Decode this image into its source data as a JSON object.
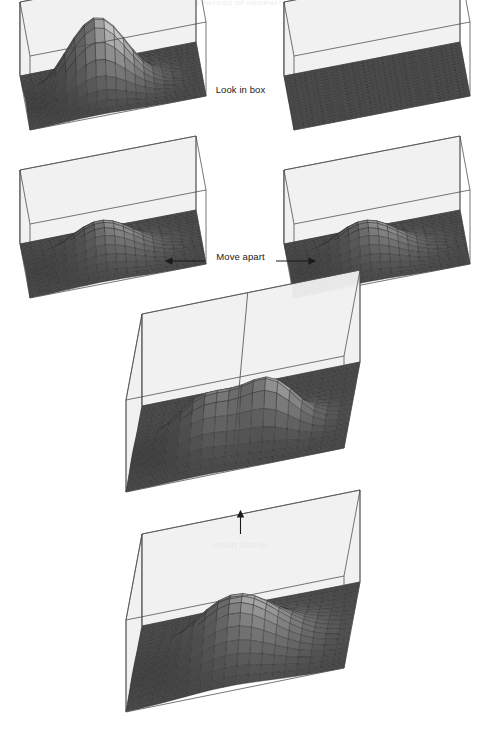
{
  "figure": {
    "header_text": "THE PHYSICS OF INFORMATION",
    "captions": {
      "look_in_box": "Look in box",
      "move_apart": "Move apart",
      "insert_barrier": "Insert barrier"
    },
    "colors": {
      "box_wall": "#f1f1f1",
      "box_edge": "#4a4a4a",
      "floor_mesh": "#6e6e6e",
      "floor_grid": "#2e2e2e",
      "surface_light": "#dedede",
      "surface_dark": "#5c5c5c",
      "text": "#1a1a1a",
      "arrow": "#1a1a1a",
      "background": "#ffffff"
    }
  },
  "chart_data": {
    "type": "surface",
    "title": "THE PHYSICS OF INFORMATION",
    "xlabel": "",
    "ylabel": "",
    "zlabel": "probability density",
    "grid": true,
    "legend": "none",
    "panels": [
      {
        "id": "top-left",
        "row": 1,
        "label": "after measurement - particle found here",
        "box": {
          "shape": "rectangular",
          "aspect": "2:1",
          "width_units": 2,
          "depth_units": 1
        },
        "peaks": [
          {
            "cx": 0.4,
            "cy": 0.46,
            "amplitude": 1.0,
            "sigma": 0.17
          }
        ],
        "total_probability": 1.0,
        "floor_grid_cells": [
          20,
          10
        ]
      },
      {
        "id": "top-right",
        "row": 1,
        "label": "after measurement - empty box",
        "box": {
          "shape": "rectangular",
          "aspect": "2:1",
          "width_units": 2,
          "depth_units": 1
        },
        "peaks": [],
        "total_probability": 0.0,
        "floor_grid_cells": [
          20,
          10
        ]
      },
      {
        "id": "middle-left",
        "row": 2,
        "label": "half probability in left box",
        "box": {
          "shape": "rectangular",
          "aspect": "2:1",
          "width_units": 2,
          "depth_units": 1
        },
        "peaks": [
          {
            "cx": 0.42,
            "cy": 0.46,
            "amplitude": 0.5,
            "sigma": 0.19
          }
        ],
        "total_probability": 0.5,
        "floor_grid_cells": [
          20,
          10
        ]
      },
      {
        "id": "middle-right",
        "row": 2,
        "label": "half probability in right box",
        "box": {
          "shape": "rectangular",
          "aspect": "2:1",
          "width_units": 2,
          "depth_units": 1
        },
        "peaks": [
          {
            "cx": 0.42,
            "cy": 0.46,
            "amplitude": 0.5,
            "sigma": 0.19
          }
        ],
        "total_probability": 0.5,
        "floor_grid_cells": [
          20,
          10
        ]
      },
      {
        "id": "center",
        "row": 3,
        "label": "barrier inserted - two half peaks",
        "box": {
          "shape": "square",
          "aspect": "1:1",
          "width_units": 1,
          "depth_units": 1,
          "barrier": true
        },
        "peaks": [
          {
            "cx": 0.33,
            "cy": 0.4,
            "amplitude": 0.5,
            "sigma": 0.15
          },
          {
            "cx": 0.63,
            "cy": 0.4,
            "amplitude": 0.5,
            "sigma": 0.12
          }
        ],
        "total_probability": 1.0,
        "floor_grid_cells": [
          16,
          16
        ]
      },
      {
        "id": "bottom",
        "row": 4,
        "label": "single particle in square box",
        "box": {
          "shape": "square",
          "aspect": "1:1",
          "width_units": 1,
          "depth_units": 1
        },
        "peaks": [
          {
            "cx": 0.46,
            "cy": 0.44,
            "amplitude": 0.62,
            "sigma": 0.2
          }
        ],
        "total_probability": 1.0,
        "floor_grid_cells": [
          16,
          16
        ]
      }
    ],
    "transitions": [
      {
        "from": "bottom",
        "to": "center",
        "label": "Insert barrier",
        "arrow": "up"
      },
      {
        "from": "center",
        "to": "middle-left",
        "label": "Move apart",
        "arrow": "left"
      },
      {
        "from": "center",
        "to": "middle-right",
        "label": "Move apart",
        "arrow": "right"
      },
      {
        "from": "middle-left",
        "to": "top-left",
        "label": "Look in box",
        "arrow": "up"
      },
      {
        "from": "middle-right",
        "to": "top-right",
        "label": "Look in box",
        "arrow": "up"
      }
    ]
  }
}
